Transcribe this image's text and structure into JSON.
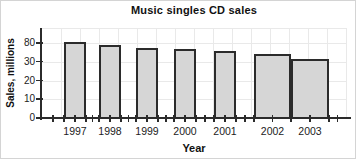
{
  "chart_data": {
    "type": "bar",
    "title": "Music singles CD sales",
    "xlabel": "Year",
    "ylabel": "Sales, millions",
    "categories": [
      "1997",
      "1998",
      "1999",
      "2000",
      "2001",
      "2002",
      "2003"
    ],
    "values": [
      82,
      75,
      68,
      63,
      58,
      50,
      37
    ],
    "ytick_labels": [
      "0",
      "10",
      "20",
      "30",
      "80"
    ],
    "ytick_values": [
      0,
      10,
      20,
      30,
      80
    ],
    "ylim_note": "equal pixel spacing between ticks; scale jumps from 30 to 80 (non-linear axis)",
    "grid": true,
    "legend": "none",
    "wide_bars": [
      "2002",
      "2003"
    ],
    "colors": {
      "background": "#ffffff",
      "bar_fill": "#d6d6d6",
      "bar_border": "#2b2b2b",
      "grid": "#e9e9e9",
      "axis": "#2b2b2b",
      "text": "#111111"
    }
  }
}
